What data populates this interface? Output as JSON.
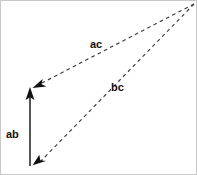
{
  "diagram": {
    "type": "vector-triangle-diagram",
    "background_color": "#ffffff",
    "stroke_color": "#1a1a1a",
    "border_color": "#c8c8c8",
    "width": 197,
    "height": 175,
    "labels": {
      "ab": "ab",
      "ac": "ac",
      "bc": "bc"
    },
    "vectors": [
      {
        "name": "ab",
        "label": "ab",
        "style": "solid",
        "from": {
          "x": 29,
          "y": 165
        },
        "to": {
          "x": 29,
          "y": 88
        },
        "arrowhead": "to",
        "label_position": {
          "x": 5,
          "y": 128
        }
      },
      {
        "name": "ac",
        "label": "ac",
        "style": "dashed",
        "from": {
          "x": 193,
          "y": 3
        },
        "to": {
          "x": 33,
          "y": 86
        },
        "arrowhead": "to",
        "label_position": {
          "x": 89,
          "y": 38
        }
      },
      {
        "name": "bc",
        "label": "bc",
        "style": "dashed",
        "from": {
          "x": 193,
          "y": 3
        },
        "to": {
          "x": 33,
          "y": 163
        },
        "arrowhead": "to",
        "label_position": {
          "x": 110,
          "y": 81
        }
      }
    ]
  }
}
